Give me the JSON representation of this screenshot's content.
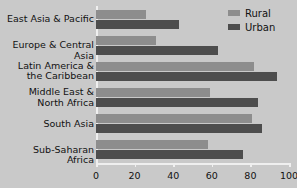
{
  "chart_data": {
    "type": "bar",
    "orientation": "horizontal",
    "title": "",
    "xlabel": "",
    "ylabel": "",
    "xlim": [
      0,
      100
    ],
    "grid": false,
    "legend_position": "top-right",
    "categories": [
      "East Asia & Pacific",
      "Latin America &\nthe Caribbean",
      "Europe & Central Asia",
      "Middle East &\nNorth Africa",
      "South Asia",
      "Sub-Saharan Africa"
    ],
    "category_lines": [
      [
        "East Asia & Pacific"
      ],
      [
        "Europe & Central Asia"
      ],
      [
        "Latin America &",
        "the Caribbean"
      ],
      [
        "Middle East &",
        "North Africa"
      ],
      [
        "South Asia"
      ],
      [
        "Sub-Saharan Africa"
      ]
    ],
    "series": [
      {
        "name": "Rural",
        "color": "#8d8d8d",
        "values": [
          26,
          31,
          82,
          59,
          81,
          58
        ]
      },
      {
        "name": "Urban",
        "color": "#4d4d4d",
        "values": [
          43,
          63,
          94,
          84,
          86,
          76
        ]
      }
    ],
    "ticks": [
      0,
      20,
      40,
      60,
      80,
      100
    ],
    "tick_labels": [
      "0",
      "20",
      "40",
      "60",
      "80",
      "100"
    ]
  },
  "legend": {
    "items": [
      {
        "label": "Rural",
        "color": "#8d8d8d"
      },
      {
        "label": "Urban",
        "color": "#4d4d4d"
      }
    ]
  },
  "colors": {
    "background": "#c9c9c9",
    "axis": "#efefef",
    "text": "#111111",
    "rural": "#8d8d8d",
    "urban": "#4d4d4d"
  }
}
